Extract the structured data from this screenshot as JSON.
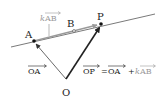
{
  "diagram": {
    "points": {
      "A": {
        "label": "A",
        "x": 34,
        "y": 41
      },
      "B": {
        "label": "B",
        "x": 74,
        "y": 31
      },
      "P": {
        "label": "P",
        "x": 101,
        "y": 24
      },
      "O": {
        "label": "O",
        "x": 66,
        "y": 79
      }
    },
    "line": {
      "x1": 11,
      "y1": 47,
      "x2": 155,
      "y2": 14
    },
    "labels": {
      "kab": {
        "k": "k",
        "vec": "AB"
      },
      "oa": {
        "vec": "OA"
      },
      "equation": {
        "lhs": "OP",
        "equals": "=",
        "term1": "OA",
        "plus": "+",
        "k": "k",
        "term2": "AB"
      }
    },
    "colors": {
      "ink": "#222222",
      "gray": "#9a9a9a",
      "line": "#7a7a7a"
    }
  }
}
